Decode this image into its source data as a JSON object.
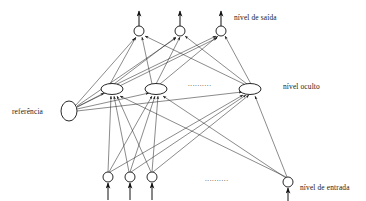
{
  "diagram": {
    "background_color": "#ffffff",
    "line_color": "#2b2b2b",
    "node_stroke_color": "#111111",
    "text_color": "#1a1a1a",
    "labels": {
      "output_layer": "nível de saída",
      "hidden_layer": "nível oculto",
      "reference": "referência",
      "input_layer": "nível de entrada"
    },
    "ellipsis": {
      "hidden_row": "..........",
      "input_row": ".........."
    },
    "layers": {
      "output": {
        "name": "nível de saída",
        "shape": "circle",
        "radius": 5,
        "y": 31,
        "nodes": [
          {
            "id": "o1",
            "x": 139,
            "y": 31
          },
          {
            "id": "o2",
            "x": 180,
            "y": 31
          },
          {
            "id": "o3",
            "x": 221,
            "y": 31
          }
        ],
        "arrow_tip_y": 10
      },
      "hidden": {
        "name": "nível oculto",
        "shape": "ellipse",
        "rx": 11,
        "ry": 5.5,
        "y": 89,
        "nodes": [
          {
            "id": "h1",
            "x": 112,
            "y": 89
          },
          {
            "id": "h2",
            "x": 156,
            "y": 89
          },
          {
            "id": "h3",
            "x": 250,
            "y": 89
          }
        ],
        "ellipsis_x": 205,
        "ellipsis_y": 85
      },
      "reference": {
        "name": "referência",
        "shape": "ellipse",
        "rx": 8,
        "ry": 10,
        "node": {
          "id": "bias",
          "x": 69,
          "y": 111
        }
      },
      "input": {
        "name": "nível de entrada",
        "shape": "circle",
        "radius": 5,
        "y": 177,
        "nodes": [
          {
            "id": "i1",
            "x": 108,
            "y": 177
          },
          {
            "id": "i2",
            "x": 130,
            "y": 177
          },
          {
            "id": "i3",
            "x": 152,
            "y": 177
          },
          {
            "id": "i4",
            "x": 288,
            "y": 182
          }
        ],
        "ellipsis_x": 222,
        "ellipsis_y": 180,
        "arrow_base_y": 200
      }
    },
    "label_positions": {
      "output_layer": {
        "x": 234,
        "y": 19
      },
      "hidden_layer": {
        "x": 283,
        "y": 88
      },
      "reference": {
        "x": 12,
        "y": 113
      },
      "input_layer": {
        "x": 300,
        "y": 189
      }
    }
  }
}
